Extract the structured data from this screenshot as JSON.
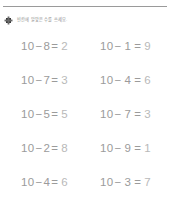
{
  "header": {
    "icon": "dark-square-bullet-icon",
    "instruction": "빈칸에 알맞은 수를 쓰세요.",
    "rule_color": "#9a9a9a"
  },
  "colors": {
    "text": "#9b9b9b",
    "answer": "#b9b9b9",
    "background": "#ffffff"
  },
  "worksheet": {
    "rows": [
      {
        "left": {
          "minuend": "10",
          "minus": "−",
          "subtrahend": "8",
          "equals": "=",
          "answer": "2"
        },
        "right": {
          "minuend": "10",
          "minus": "−",
          "subtrahend": "1",
          "equals": "=",
          "answer": "9"
        }
      },
      {
        "left": {
          "minuend": "10",
          "minus": "−",
          "subtrahend": "7",
          "equals": "=",
          "answer": "3"
        },
        "right": {
          "minuend": "10",
          "minus": "−",
          "subtrahend": "4",
          "equals": "=",
          "answer": "6"
        }
      },
      {
        "left": {
          "minuend": "10",
          "minus": "−",
          "subtrahend": "5",
          "equals": "=",
          "answer": "5"
        },
        "right": {
          "minuend": "10",
          "minus": "−",
          "subtrahend": "7",
          "equals": "=",
          "answer": "3"
        }
      },
      {
        "left": {
          "minuend": "10",
          "minus": "−",
          "subtrahend": "2",
          "equals": "=",
          "answer": "8"
        },
        "right": {
          "minuend": "10",
          "minus": "−",
          "subtrahend": "9",
          "equals": "=",
          "answer": "1"
        }
      },
      {
        "left": {
          "minuend": "10",
          "minus": "−",
          "subtrahend": "4",
          "equals": "=",
          "answer": "6"
        },
        "right": {
          "minuend": "10",
          "minus": "−",
          "subtrahend": "3",
          "equals": "=",
          "answer": "7"
        }
      }
    ]
  }
}
